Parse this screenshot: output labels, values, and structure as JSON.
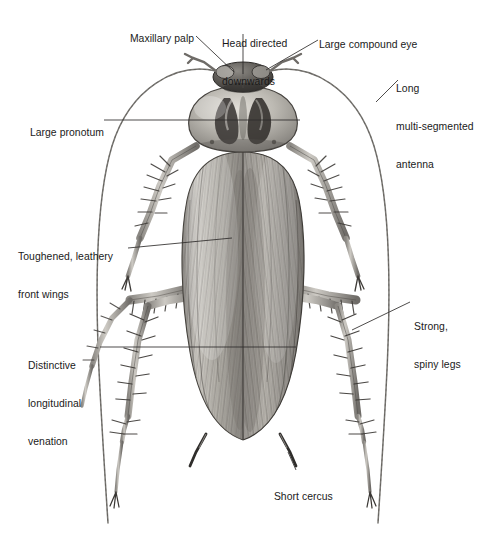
{
  "figure": {
    "title": "",
    "background_color": "#ffffff",
    "ink_color": "#1a1a1a",
    "leader_color": "#3a3a3a"
  },
  "labels": [
    {
      "id": "maxillary-palp",
      "text": "Maxillary palp",
      "lines": [
        "Maxillary palp"
      ],
      "x": 124,
      "y": 20,
      "align": "left"
    },
    {
      "id": "head-directed-downwards",
      "text": "Head directed downwards",
      "lines": [
        "Head directed",
        "downwards"
      ],
      "x": 222,
      "y": 13,
      "align": "left"
    },
    {
      "id": "large-compound-eye",
      "text": "Large compound eye",
      "lines": [
        "Large compound eye"
      ],
      "x": 313,
      "y": 26,
      "align": "left"
    },
    {
      "id": "long-multi-segmented-antenna",
      "text": "Long multi-segmented antenna",
      "lines": [
        "Long",
        "multi-segmented",
        "antenna"
      ],
      "x": 396,
      "y": 58,
      "align": "left"
    },
    {
      "id": "large-pronotum",
      "text": "Large pronotum",
      "lines": [
        "Large pronotum"
      ],
      "x": 24,
      "y": 114,
      "align": "left"
    },
    {
      "id": "toughened-leathery-front-wings",
      "text": "Toughened, leathery front wings",
      "lines": [
        "Toughened, leathery",
        "front wings"
      ],
      "x": 18,
      "y": 226,
      "align": "left"
    },
    {
      "id": "distinctive-longitudinal-venation",
      "text": "Distinctive longitudinal venation",
      "lines": [
        "Distinctive",
        "longitudinal",
        "venation"
      ],
      "x": 28,
      "y": 335,
      "align": "left"
    },
    {
      "id": "strong-spiny-legs",
      "text": "Strong, spiny legs",
      "lines": [
        "Strong,",
        "spiny legs"
      ],
      "x": 414,
      "y": 296,
      "align": "left"
    },
    {
      "id": "short-cercus",
      "text": "Short cercus",
      "lines": [
        "Short cercus"
      ],
      "x": 268,
      "y": 478,
      "align": "left"
    }
  ],
  "anatomy_parts": [
    "head",
    "maxillary-palp",
    "compound-eye",
    "antenna-left",
    "antenna-right",
    "pronotum",
    "front-wing-left",
    "front-wing-right",
    "wing-venation",
    "foreleg-left",
    "foreleg-right",
    "midleg-left",
    "midleg-right",
    "hindleg-left",
    "hindleg-right",
    "cercus-left",
    "cercus-right"
  ]
}
